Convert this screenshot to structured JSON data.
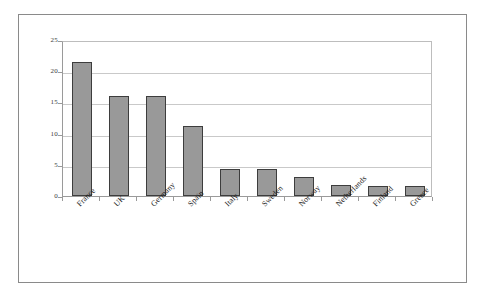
{
  "chart_data": {
    "type": "bar",
    "title": "",
    "subtitle": "",
    "xlabel": "",
    "ylabel": "",
    "categories": [
      "France",
      "UK",
      "Germany",
      "Spain",
      "Italy",
      "Sweden",
      "Norway",
      "Netherlands",
      "Finland",
      "Greece"
    ],
    "values": [
      21.5,
      16.0,
      16.0,
      11.2,
      4.3,
      4.3,
      3.1,
      1.7,
      1.6,
      1.6
    ],
    "series": [
      {
        "name": "",
        "values": [
          21.5,
          16.0,
          16.0,
          11.2,
          4.3,
          4.3,
          3.1,
          1.7,
          1.6,
          1.6
        ]
      }
    ],
    "ylim": [
      0,
      25
    ],
    "yticks": [
      0,
      5,
      10,
      15,
      20,
      25
    ],
    "ytick_labels": [
      "0",
      "5",
      "10",
      "15",
      "20",
      "25"
    ],
    "grid": "horizontal",
    "legend": "none",
    "bar_color": "#999999",
    "bar_border_color": "#3d3d3d",
    "gridline_color": "#c9c9c9",
    "axis_color": "#9a9a9a",
    "frame_color": "#8a8a8a",
    "background_color": "#ffffff",
    "xtick_label_rotation": -45
  }
}
